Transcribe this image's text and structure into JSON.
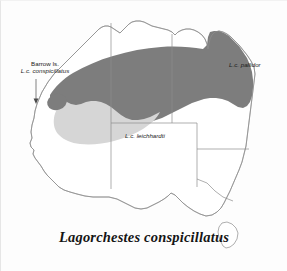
{
  "figure": {
    "caption": "Lagorchestes conspicillatus",
    "background_color": "#fdfdfd"
  },
  "map": {
    "region": "Australia",
    "outline_color": "#8c8c8c",
    "state_boundary_color": "#8c8c8c",
    "land_fill": "#ffffff"
  },
  "labels": {
    "barrow": {
      "line1": "Barrow Is.",
      "line2": "L.c. conspicillatus"
    },
    "pallidor": {
      "text": "L.c. pallidor"
    },
    "leichhardti": {
      "text": "L.c. leichhardti"
    }
  },
  "distribution": {
    "dark": {
      "name": "L.c. pallidor",
      "color": "#7d7d7d"
    },
    "light": {
      "name": "L.c. leichhardti",
      "color": "#d6d6d6"
    },
    "barrow_island": {
      "name": "L.c. conspicillatus",
      "color": "#7d7d7d"
    }
  }
}
